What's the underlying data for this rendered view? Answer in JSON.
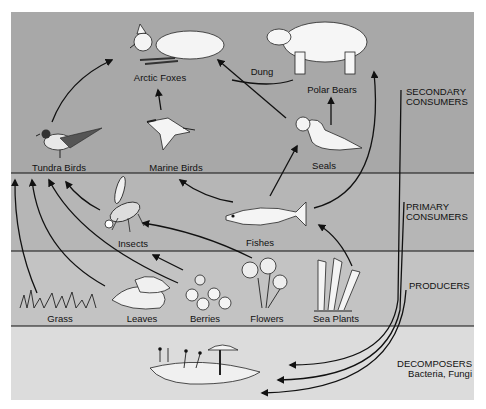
{
  "colors": {
    "secondary_band": "#a8a8a8",
    "primary_band": "#b6b6b6",
    "producers_band": "#c3c3c3",
    "decomposers_band": "#dcdcdc",
    "line": "#111111",
    "organism_fill": "#f4f4f4"
  },
  "levels": [
    {
      "id": "secondary",
      "label_line1": "SECONDARY",
      "label_line2": "CONSUMERS"
    },
    {
      "id": "primary",
      "label_line1": "PRIMARY",
      "label_line2": "CONSUMERS"
    },
    {
      "id": "producers",
      "label_line1": "PRODUCERS",
      "label_line2": ""
    },
    {
      "id": "decomposers",
      "label_line1": "DECOMPOSERS",
      "label_line2": "Bacteria, Fungi"
    }
  ],
  "organisms": {
    "arctic_foxes": "Arctic Foxes",
    "polar_bears": "Polar Bears",
    "dung": "Dung",
    "tundra_birds": "Tundra Birds",
    "marine_birds": "Marine Birds",
    "seals": "Seals",
    "insects": "Insects",
    "fishes": "Fishes",
    "grass": "Grass",
    "leaves": "Leaves",
    "berries": "Berries",
    "flowers": "Flowers",
    "sea_plants": "Sea Plants"
  },
  "links": [
    {
      "from": "Tundra Birds",
      "to": "Arctic Foxes"
    },
    {
      "from": "Marine Birds",
      "to": "Arctic Foxes"
    },
    {
      "from": "Seals",
      "to": "Arctic Foxes"
    },
    {
      "from": "Seals",
      "to": "Polar Bears"
    },
    {
      "from": "Polar Bears",
      "to": "Dung"
    },
    {
      "from": "Fishes",
      "to": "Seals"
    },
    {
      "from": "Fishes",
      "to": "Marine Birds"
    },
    {
      "from": "Fishes",
      "to": "Polar Bears"
    },
    {
      "from": "Insects",
      "to": "Tundra Birds"
    },
    {
      "from": "Flowers",
      "to": "Insects"
    },
    {
      "from": "Berries",
      "to": "Insects"
    },
    {
      "from": "Sea Plants",
      "to": "Fishes"
    },
    {
      "from": "Grass",
      "to": "Tundra Birds"
    },
    {
      "from": "Leaves",
      "to": "Tundra Birds"
    },
    {
      "from": "Berries",
      "to": "Tundra Birds"
    },
    {
      "from": "Secondary Consumers",
      "to": "Decomposers"
    },
    {
      "from": "Primary Consumers",
      "to": "Decomposers"
    },
    {
      "from": "Producers",
      "to": "Decomposers"
    }
  ]
}
